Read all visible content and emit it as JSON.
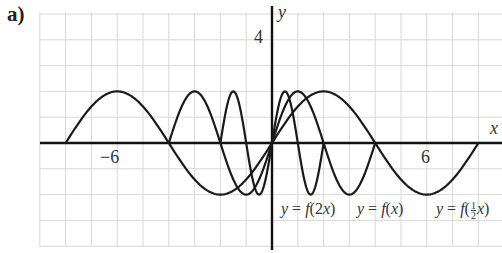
{
  "figure": {
    "part_label": "a)",
    "x_axis_name": "x",
    "y_axis_name": "y",
    "x_tick_labels": [
      {
        "text": "−6",
        "value": -6
      },
      {
        "text": "6",
        "value": 6
      }
    ],
    "y_tick_labels": [
      {
        "text": "4",
        "value": 4
      }
    ],
    "curve_labels": [
      {
        "prefix": "y = f(",
        "arg": "2x",
        "suffix": ")"
      },
      {
        "prefix": "y = f(",
        "arg": "x",
        "suffix": ")"
      },
      {
        "prefix": "y = f(",
        "arg": "½x",
        "suffix": ")"
      }
    ],
    "colors": {
      "grid": "#d8d8d8",
      "axes": "#111111",
      "curves": "#1a1a1a",
      "background": "#ffffff"
    }
  },
  "chart_data": {
    "type": "line",
    "title": "a)",
    "xlabel": "x",
    "ylabel": "y",
    "xlim": [
      -9,
      9
    ],
    "ylim": [
      -4,
      5
    ],
    "grid": true,
    "grid_step": 1,
    "labeled_ticks": {
      "x": [
        -6,
        6
      ],
      "y": [
        4
      ]
    },
    "legend": "inline labels below curves",
    "series": [
      {
        "name": "y = f(2x)",
        "domain": [
          -2,
          2
        ],
        "amplitude": 2,
        "period": 2,
        "points": [
          [
            -2,
            0
          ],
          [
            -1.5,
            2
          ],
          [
            -1,
            0
          ],
          [
            -0.5,
            -2
          ],
          [
            0,
            0
          ],
          [
            0.5,
            2
          ],
          [
            1,
            0
          ],
          [
            1.5,
            -2
          ],
          [
            2,
            0
          ]
        ]
      },
      {
        "name": "y = f(x)",
        "domain": [
          -4,
          4
        ],
        "amplitude": 2,
        "period": 4,
        "points": [
          [
            -4,
            0
          ],
          [
            -3,
            2
          ],
          [
            -2,
            0
          ],
          [
            -1,
            -2
          ],
          [
            0,
            0
          ],
          [
            1,
            2
          ],
          [
            2,
            0
          ],
          [
            3,
            -2
          ],
          [
            4,
            0
          ]
        ]
      },
      {
        "name": "y = f(½x)",
        "domain": [
          -8,
          8
        ],
        "amplitude": 2,
        "period": 8,
        "points": [
          [
            -8,
            0
          ],
          [
            -6,
            2
          ],
          [
            -4,
            0
          ],
          [
            -2,
            -2
          ],
          [
            0,
            0
          ],
          [
            2,
            2
          ],
          [
            4,
            0
          ],
          [
            6,
            -2
          ],
          [
            8,
            0
          ]
        ]
      }
    ]
  }
}
